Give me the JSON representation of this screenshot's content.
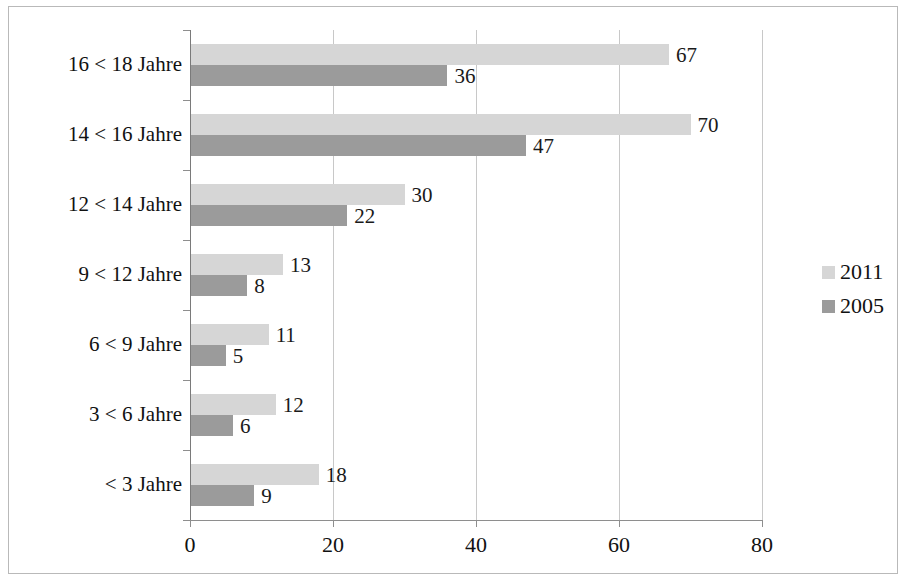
{
  "chart_data": {
    "type": "bar",
    "orientation": "horizontal",
    "title": "",
    "xlabel": "",
    "ylabel": "",
    "xlim": [
      0,
      80
    ],
    "xticks": [
      0,
      20,
      40,
      60,
      80
    ],
    "xtick_labels": [
      "0",
      "20",
      "40",
      "60",
      "80"
    ],
    "grid": true,
    "legend_position": "right",
    "categories": [
      "16 < 18 Jahre",
      "14 < 16 Jahre",
      "12 < 14 Jahre",
      "9 < 12 Jahre",
      "6 < 9 Jahre",
      "3 < 6 Jahre",
      "< 3 Jahre"
    ],
    "series": [
      {
        "name": "2011",
        "color": "#d6d6d6",
        "values": [
          67,
          70,
          30,
          13,
          11,
          12,
          18
        ]
      },
      {
        "name": "2005",
        "color": "#9b9b9b",
        "values": [
          36,
          47,
          22,
          8,
          5,
          6,
          9
        ]
      }
    ]
  },
  "legend": {
    "items": [
      {
        "label": "2011",
        "color": "#d6d6d6"
      },
      {
        "label": "2005",
        "color": "#9b9b9b"
      }
    ]
  }
}
